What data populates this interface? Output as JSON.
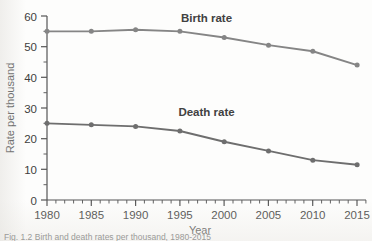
{
  "figure": {
    "background_color": "#fdfdfc",
    "caption_partial": "Fig. 1.2   Birth and death rates per thousand, 1980-2015"
  },
  "chart_data": {
    "type": "line",
    "title": "",
    "xlabel": "Year",
    "ylabel": "Rate per thousand",
    "x": [
      1980,
      1985,
      1990,
      1995,
      2000,
      2005,
      2010,
      2015
    ],
    "xticklabels": [
      "1980",
      "1985",
      "1990",
      "1995",
      "2000",
      "2005",
      "2010",
      "2015"
    ],
    "xlim": [
      1980,
      2016
    ],
    "ylim": [
      0,
      60
    ],
    "yticks": [
      0,
      10,
      20,
      30,
      40,
      50,
      60
    ],
    "yticklabels": [
      "0",
      "10",
      "20",
      "30",
      "40",
      "50",
      "60"
    ],
    "y_minor_tick_step": 5,
    "x_minor_tick_step": 1,
    "grid": false,
    "legend_position": "inline-annotation",
    "marker": "circle",
    "series": [
      {
        "name": "Birth rate",
        "color": "#858585",
        "label_text": "Birth rate",
        "values": [
          55,
          55,
          55.5,
          55,
          53,
          50.5,
          48.5,
          44
        ]
      },
      {
        "name": "Death rate",
        "color": "#6e6e6e",
        "label_text": "Death rate",
        "values": [
          25,
          24.5,
          24,
          22.5,
          19,
          16,
          13,
          11.5
        ]
      }
    ],
    "annotations": [
      {
        "text": "Birth rate",
        "x": 1998,
        "y": 58
      },
      {
        "text": "Death rate",
        "x": 1998,
        "y": 27.5
      }
    ]
  }
}
